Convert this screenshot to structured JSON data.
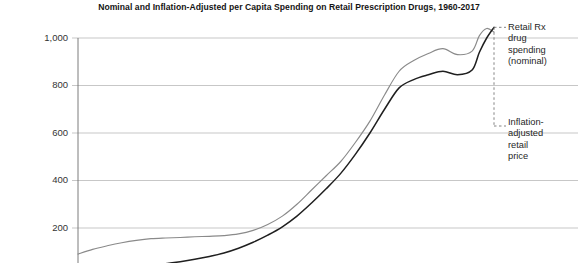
{
  "chart_data": {
    "type": "line",
    "title": "Nominal and Inflation-Adjusted per Capita Spending on Retail Prescription Drugs, 1960-2017",
    "xlabel": "",
    "ylabel": "",
    "xlim": [
      1960,
      2017
    ],
    "ylim": [
      0,
      1080
    ],
    "grid": true,
    "gridlines": [
      200,
      400,
      600,
      800,
      1000
    ],
    "ytick_labels": [
      "200",
      "400",
      "600",
      "800",
      "1,000"
    ],
    "ytick_values": [
      200,
      400,
      600,
      800,
      1000
    ],
    "legend_position": "right-annotations",
    "x": [
      1960,
      1962,
      1964,
      1966,
      1968,
      1970,
      1972,
      1974,
      1976,
      1978,
      1980,
      1982,
      1984,
      1986,
      1988,
      1990,
      1992,
      1994,
      1996,
      1998,
      2000,
      2002,
      2004,
      2006,
      2008,
      2010,
      2012,
      2014,
      2015,
      2016,
      2017
    ],
    "series": [
      {
        "name": "Inflation-adjusted retail price",
        "color": "#8a8a8a",
        "values": [
          90,
          110,
          125,
          138,
          148,
          155,
          158,
          160,
          163,
          165,
          168,
          175,
          190,
          215,
          250,
          300,
          360,
          420,
          480,
          560,
          650,
          760,
          860,
          905,
          935,
          955,
          930,
          945,
          1010,
          1040,
          1025
        ]
      },
      {
        "name": "Retail Rx drug spending (nominal)",
        "color": "#1f1f1f",
        "values": [
          22,
          26,
          30,
          34,
          39,
          45,
          50,
          58,
          68,
          80,
          95,
          115,
          140,
          170,
          205,
          250,
          305,
          365,
          430,
          510,
          600,
          700,
          790,
          825,
          845,
          860,
          845,
          865,
          940,
          1000,
          1045
        ]
      }
    ],
    "annotations": [
      {
        "id": "nominal",
        "lines": [
          "Retail Rx",
          "drug",
          "spending",
          "(nominal)"
        ],
        "text": "Retail Rx drug spending (nominal)",
        "target_value": 1045
      },
      {
        "id": "real",
        "lines": [
          "Inflation-",
          "adjusted",
          "retail",
          "price"
        ],
        "text": "Inflation-adjusted retail price",
        "target_value": 1025
      }
    ]
  },
  "axis": {
    "tick_1000": "1,000",
    "tick_800": "800",
    "tick_600": "600",
    "tick_400": "400",
    "tick_200": "200"
  },
  "annotation_text": {
    "nominal_l1": "Retail Rx",
    "nominal_l2": "drug",
    "nominal_l3": "spending",
    "nominal_l4": "(nominal)",
    "real_l1": "Inflation-",
    "real_l2": "adjusted",
    "real_l3": "retail",
    "real_l4": "price"
  },
  "colors": {
    "nominal_line": "#1f1f1f",
    "real_line": "#8a8a8a",
    "gridline": "#b9b9b9",
    "axis": "#6e6e6e",
    "leader": "#6e6e6e"
  }
}
